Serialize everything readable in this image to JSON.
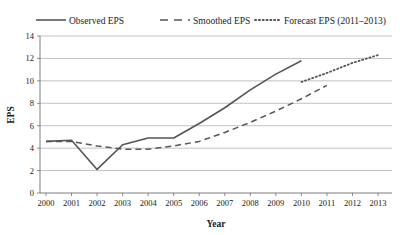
{
  "chart_data": {
    "type": "line",
    "title": "",
    "xlabel": "Year",
    "ylabel": "EPS",
    "x": [
      2000,
      2001,
      2002,
      2003,
      2004,
      2005,
      2006,
      2007,
      2008,
      2009,
      2010,
      2011,
      2012,
      2013
    ],
    "xlim": [
      2000,
      2013
    ],
    "ylim": [
      0,
      14
    ],
    "yticks": [
      0,
      2,
      4,
      6,
      8,
      10,
      12,
      14
    ],
    "xticks": [
      "2000",
      "2001",
      "2002",
      "2003",
      "2004",
      "2005",
      "2006",
      "2007",
      "2008",
      "2009",
      "2010",
      "2011",
      "2012",
      "2013"
    ],
    "ytick_labels": [
      "0",
      "2",
      "4",
      "6",
      "8",
      "10",
      "12",
      "14"
    ],
    "grid": "horizontal",
    "legend_position": "top",
    "series": [
      {
        "name": "Observed EPS",
        "style": "solid",
        "color": "#555555",
        "x": [
          2000,
          2001,
          2002,
          2003,
          2004,
          2005,
          2006,
          2007,
          2008,
          2009,
          2010
        ],
        "values": [
          4.6,
          4.7,
          2.1,
          4.3,
          4.9,
          4.9,
          6.2,
          7.6,
          9.2,
          10.6,
          11.8
        ]
      },
      {
        "name": "Smoothed EPS",
        "style": "dashed",
        "color": "#555555",
        "x": [
          2000,
          2001,
          2002,
          2003,
          2004,
          2005,
          2006,
          2007,
          2008,
          2009,
          2010,
          2011
        ],
        "values": [
          4.6,
          4.6,
          4.2,
          3.9,
          3.9,
          4.2,
          4.6,
          5.4,
          6.3,
          7.3,
          8.4,
          9.6
        ]
      },
      {
        "name": "Forecast EPS (2011–2013)",
        "style": "dotted",
        "color": "#555555",
        "x": [
          2010,
          2011,
          2012,
          2013
        ],
        "values": [
          9.9,
          10.7,
          11.6,
          12.3
        ]
      }
    ]
  },
  "legend": {
    "items": [
      {
        "label": "Observed EPS",
        "style": "solid"
      },
      {
        "label": "Smoothed EPS",
        "style": "dashed"
      },
      {
        "label": "Forecast EPS (2011–2013)",
        "style": "dotted"
      }
    ]
  },
  "axes": {
    "y_title": "EPS",
    "x_title": "Year"
  }
}
